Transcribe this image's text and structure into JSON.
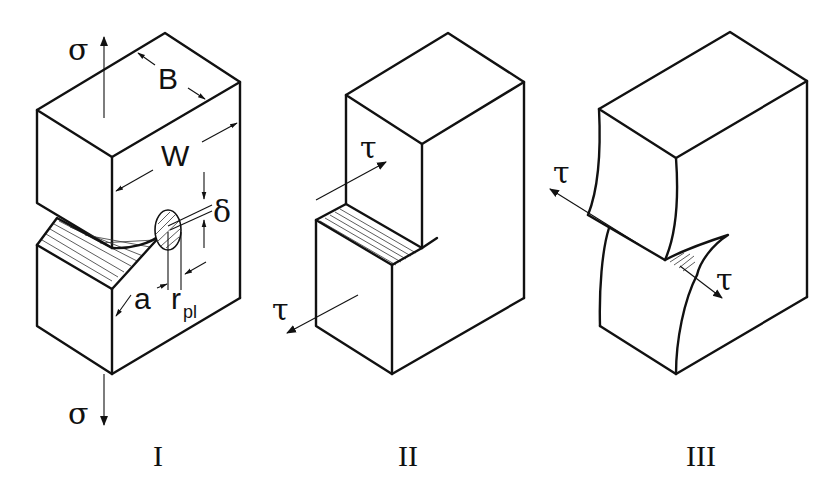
{
  "figure": {
    "panels": [
      {
        "id": "I",
        "caption": "I",
        "mode": "opening",
        "labels": {
          "stress_top": "σ",
          "stress_bottom": "σ",
          "thickness": "B",
          "width": "W",
          "crack_length": "a",
          "plastic_zone_prefix": "r",
          "plastic_zone_sub": "pl",
          "crack_opening": "δ"
        }
      },
      {
        "id": "II",
        "caption": "II",
        "mode": "in-plane shear (sliding)",
        "labels": {
          "shear_top": "τ",
          "shear_bottom": "τ"
        }
      },
      {
        "id": "III",
        "caption": "III",
        "mode": "out-of-plane shear (tearing)",
        "labels": {
          "shear_left": "τ",
          "shear_right": "τ"
        }
      }
    ]
  },
  "colors": {
    "line": "#111111",
    "background": "#ffffff",
    "hatch": "#333333"
  }
}
